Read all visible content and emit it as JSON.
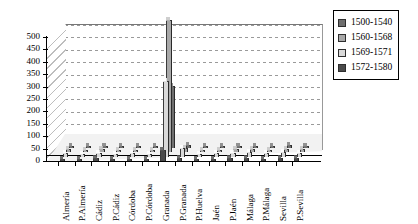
{
  "chart_data": {
    "type": "bar",
    "title": "",
    "subtitle": "",
    "xlabel": "",
    "ylabel": "",
    "ylim": [
      0,
      500
    ],
    "ytick_step": 50,
    "grid": true,
    "three_d": true,
    "legend_position": "right",
    "categories": [
      "Almería",
      "P.Almería",
      "Cádiz",
      "P.Cádiz",
      "Córdoba",
      "P.Córdoba",
      "Granada",
      "P.Granada",
      "P.Huelva",
      "Jaén",
      "P.Jaén",
      "Málaga",
      "P.Málaga",
      "Sevilla",
      "P.Sevilla"
    ],
    "ytick_labels": [
      "0",
      "50",
      "100",
      "150",
      "200",
      "250",
      "300",
      "350",
      "400",
      "450",
      "500"
    ],
    "series": [
      {
        "name": "1500-1540",
        "color": "#6e6e6e",
        "values": [
          5,
          4,
          6,
          3,
          5,
          4,
          245,
          8,
          3,
          4,
          5,
          6,
          4,
          7,
          5
        ]
      },
      {
        "name": "1560-1568",
        "color": "#a8a8a8",
        "values": [
          8,
          6,
          9,
          5,
          7,
          6,
          530,
          12,
          5,
          7,
          8,
          10,
          7,
          11,
          8
        ]
      },
      {
        "name": "1569-1571",
        "color": "#d9d9d9",
        "values": [
          10,
          8,
          12,
          7,
          9,
          8,
          300,
          30,
          8,
          10,
          12,
          14,
          10,
          15,
          12
        ]
      },
      {
        "name": "1572-1580",
        "color": "#4a4a4a",
        "values": [
          6,
          5,
          8,
          4,
          6,
          5,
          40,
          10,
          4,
          6,
          7,
          9,
          6,
          10,
          7
        ]
      }
    ]
  }
}
